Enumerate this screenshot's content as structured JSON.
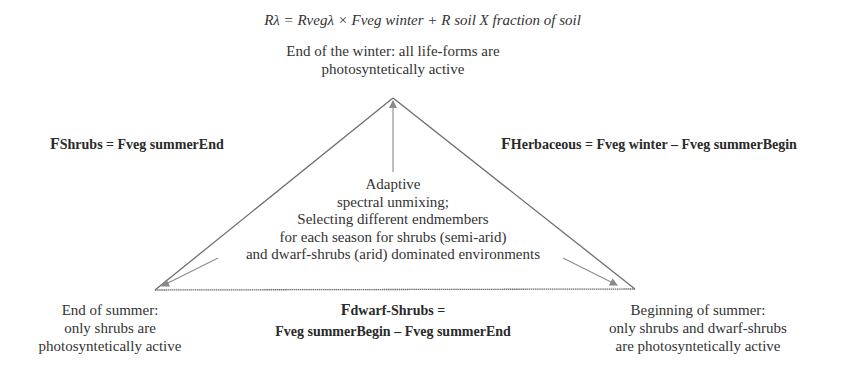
{
  "formula": "Rλ = Rvegλ × Fveg winter + R soil X fraction of soil",
  "apex_label": {
    "line1": "End of the winter: all life-forms are",
    "line2": "photosyntetically active"
  },
  "left_formula": {
    "prefix": "F",
    "text": "Shrubs = Fveg summerEnd"
  },
  "right_formula": {
    "prefix": "F",
    "text": "Herbaceous = Fveg winter – Fveg summerBegin"
  },
  "center_text": {
    "line1": "Adaptive",
    "line2": "spectral unmixing;",
    "line3": "Selecting different endmembers",
    "line4": "for each season for shrubs (semi-arid)",
    "line5": "and dwarf-shrubs (arid) dominated environments"
  },
  "bottom_left_label": {
    "line1": "End of summer:",
    "line2": "only shrubs are",
    "line3": "photosyntetically active"
  },
  "bottom_center_formula": {
    "line1_prefix": "F",
    "line1": "dwarf-Shrubs =",
    "line2": "Fveg summerBegin – Fveg summerEnd"
  },
  "bottom_right_label": {
    "line1": "Beginning of summer:",
    "line2": "only shrubs and dwarf-shrubs",
    "line3": "are photosyntetically active"
  },
  "geometry": {
    "apex": [
      393,
      98
    ],
    "left_corner": [
      155,
      290
    ],
    "right_corner": [
      635,
      289
    ],
    "line_color": "#6e6e6e",
    "arrow_color": "#8a8a8a"
  }
}
